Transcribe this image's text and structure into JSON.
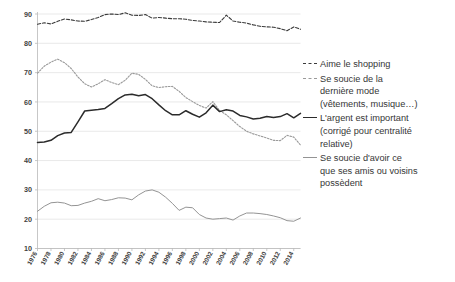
{
  "chart_data": {
    "type": "line",
    "title": "",
    "xlabel": "",
    "ylabel": "",
    "ylim": [
      10,
      90
    ],
    "yticks": [
      10,
      20,
      30,
      40,
      50,
      60,
      70,
      80,
      90
    ],
    "ytick_labels": [
      "10",
      "20",
      "30",
      "40",
      "50",
      "60",
      "70",
      "80",
      "90"
    ],
    "grid": true,
    "legend_position": "right",
    "xlim": [
      1976,
      2015
    ],
    "x": [
      1976,
      1977,
      1978,
      1979,
      1980,
      1981,
      1982,
      1983,
      1984,
      1985,
      1986,
      1987,
      1988,
      1989,
      1990,
      1991,
      1992,
      1993,
      1994,
      1995,
      1996,
      1997,
      1998,
      1999,
      2000,
      2001,
      2002,
      2003,
      2004,
      2005,
      2006,
      2007,
      2008,
      2009,
      2010,
      2011,
      2012,
      2013,
      2014,
      2015
    ],
    "xtick_labels": [
      "1976",
      "1978",
      "1980",
      "1982",
      "1984",
      "1986",
      "1988",
      "1990",
      "1992",
      "1994",
      "1996",
      "1998",
      "2000",
      "2002",
      "2004",
      "2006",
      "2008",
      "2010",
      "2012",
      "2014"
    ],
    "xticks": [
      1976,
      1978,
      1980,
      1982,
      1984,
      1986,
      1988,
      1990,
      1992,
      1994,
      1996,
      1998,
      2000,
      2002,
      2004,
      2006,
      2008,
      2010,
      2012,
      2014
    ],
    "series": [
      {
        "name": "Aime le shopping",
        "style": "dashed",
        "color": "#3a3a3a",
        "width": 1.1,
        "values": [
          86.5,
          87.0,
          86.6,
          87.5,
          88.3,
          88.0,
          87.6,
          87.5,
          88.1,
          88.8,
          89.8,
          90.0,
          89.8,
          90.4,
          89.6,
          89.5,
          89.8,
          88.6,
          88.8,
          88.6,
          88.4,
          88.4,
          88.2,
          87.8,
          87.6,
          87.3,
          87.2,
          87.1,
          89.6,
          87.6,
          87.2,
          86.9,
          86.3,
          85.8,
          85.6,
          85.5,
          85.0,
          84.3,
          85.6,
          84.8
        ]
      },
      {
        "name": "Se soucie de la dernière mode (vêtements, musique…)",
        "style": "dotted",
        "color": "#9a9a9a",
        "width": 1.1,
        "values": [
          69.8,
          72.2,
          73.6,
          74.6,
          73.4,
          71.4,
          68.5,
          66.2,
          65.1,
          66.2,
          67.6,
          66.6,
          65.9,
          67.4,
          69.8,
          69.4,
          67.7,
          65.5,
          64.9,
          65.2,
          65.3,
          63.6,
          61.5,
          60.1,
          58.8,
          57.9,
          60.1,
          57.1,
          55.6,
          53.6,
          51.6,
          50.0,
          49.1,
          48.4,
          47.7,
          46.9,
          46.8,
          48.6,
          48.0,
          45.3
        ]
      },
      {
        "name": "L'argent est important (corrigé pour centralité relative)",
        "style": "solid",
        "color": "#2b2b2b",
        "width": 1.5,
        "values": [
          46.2,
          46.3,
          46.9,
          48.5,
          49.4,
          49.6,
          53.2,
          56.9,
          57.2,
          57.4,
          57.8,
          59.4,
          61.1,
          62.4,
          62.6,
          62.1,
          62.5,
          61.1,
          59.0,
          57.0,
          55.6,
          55.6,
          57.0,
          55.8,
          54.8,
          56.3,
          58.9,
          56.7,
          57.3,
          56.9,
          55.4,
          54.9,
          54.2,
          54.4,
          55.0,
          54.7,
          55.0,
          56.0,
          54.6,
          56.1
        ]
      },
      {
        "name": "Se soucie d'avoir ce que ses amis ou voisins possèdent",
        "style": "solid",
        "color": "#949494",
        "width": 1.0,
        "values": [
          22.7,
          24.4,
          25.6,
          25.8,
          25.5,
          24.6,
          24.7,
          25.5,
          26.1,
          27.0,
          26.3,
          26.7,
          27.3,
          27.2,
          26.6,
          28.3,
          29.6,
          30.0,
          29.2,
          27.5,
          25.4,
          23.0,
          24.1,
          23.9,
          21.6,
          20.4,
          20.0,
          20.2,
          20.4,
          19.7,
          21.1,
          22.1,
          22.1,
          21.9,
          21.6,
          21.1,
          20.5,
          19.5,
          19.3,
          20.4
        ]
      }
    ]
  },
  "legend": {
    "entries": [
      {
        "marker": "dashed",
        "lines": [
          "Aime le shopping"
        ]
      },
      {
        "marker": "dotted",
        "lines": [
          "Se soucie de la",
          "dernière mode",
          "(vêtements, musique…)"
        ]
      },
      {
        "marker": "solid-dark",
        "lines": [
          "L'argent est important",
          "(corrigé pour centralité",
          "relative)"
        ]
      },
      {
        "marker": "solid-gray",
        "lines": [
          "Se soucie d'avoir ce",
          "que ses amis ou voisins",
          "possèdent"
        ]
      }
    ]
  },
  "colors": {
    "grid": "#e3e3e3",
    "axis": "#b9b9b9",
    "text": "#3a3a3a",
    "series_dark": "#2b2b2b",
    "series_gray": "#949494"
  }
}
